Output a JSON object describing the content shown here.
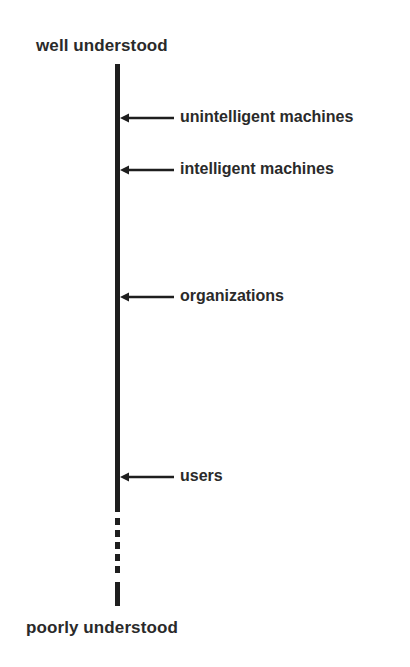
{
  "diagram": {
    "top_label": "well understood",
    "bottom_label": "poorly understood",
    "markers": [
      {
        "label": "unintelligent machines",
        "y": 118
      },
      {
        "label": "intelligent machines",
        "y": 170
      },
      {
        "label": "organizations",
        "y": 297
      },
      {
        "label": "users",
        "y": 477
      }
    ]
  }
}
